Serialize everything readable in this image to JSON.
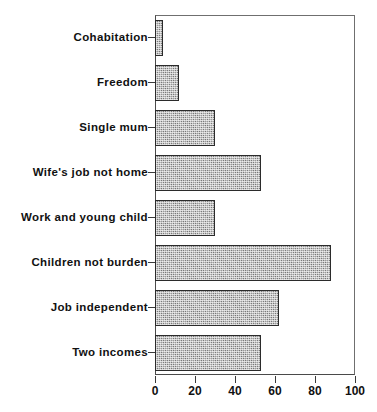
{
  "chart_data": {
    "type": "bar",
    "orientation": "horizontal",
    "title": "",
    "xlabel": "",
    "ylabel": "",
    "xlim": [
      0,
      100
    ],
    "xticks": [
      0,
      20,
      40,
      60,
      80,
      100
    ],
    "tick_labels": [
      "0",
      "20",
      "40",
      "60",
      "80",
      "100"
    ],
    "grid": false,
    "legend": false,
    "bar_fill": "#9a9a9a",
    "bar_edge": "#2b2b2b",
    "axis_color": "#4a4a4a",
    "categories": [
      "Cohabitation",
      "Freedom",
      "Single mum",
      "Wife's job not home",
      "Work and young child",
      "Children not burden",
      "Job independent",
      "Two incomes"
    ],
    "values": [
      4,
      12,
      30,
      53,
      30,
      88,
      62,
      53
    ]
  }
}
